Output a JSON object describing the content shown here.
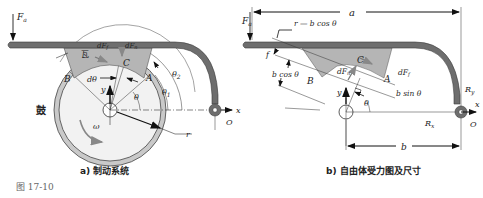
{
  "figure": {
    "number": "图 17-10",
    "panels": [
      {
        "id": "a",
        "caption": "a) 制动系统",
        "labels": {
          "force_applied": "F",
          "force_applied_sub": "a",
          "drum": "鼓",
          "shoe_lining": "瓦",
          "point_A": "A",
          "point_B": "B",
          "point_C": "C",
          "dF_f": "dF",
          "dF_f_sub": "f",
          "dF_n": "dF",
          "dF_n_sub": "n",
          "d_theta": "dθ",
          "theta": "θ",
          "theta1": "θ",
          "theta1_sub": "1",
          "theta2": "θ",
          "theta2_sub": "2",
          "omega": "ω",
          "radius": "r",
          "pivot": "O",
          "axis_x": "x",
          "axis_y": "y"
        }
      },
      {
        "id": "b",
        "caption": "b) 自由体受力图及尺寸",
        "labels": {
          "force_applied": "F",
          "force_applied_sub": "a",
          "dim_a": "a",
          "dim_b": "b",
          "r_minus_bcos": "r — b cos θ",
          "b_cos": "b cos θ",
          "b_sin": "b sin θ",
          "offset_f": "f",
          "point_A": "A",
          "point_B": "B",
          "point_C": "C",
          "dF_n": "dF",
          "dF_n_sub": "n",
          "dF_f": "dF",
          "dF_f_sub": "f",
          "theta": "θ",
          "R_x": "R",
          "R_x_sub": "x",
          "R_y": "R",
          "R_y_sub": "y",
          "pivot": "O",
          "axis_x": "x",
          "axis_y": "y"
        }
      }
    ],
    "colors": {
      "lever": "#6e6e6e",
      "lever_edge": "#3a3a3a",
      "shoe": "#b5b5b5",
      "drum_rim": "#c9c9c9",
      "drum_face": "#f2f2f2",
      "line": "#222222"
    }
  }
}
